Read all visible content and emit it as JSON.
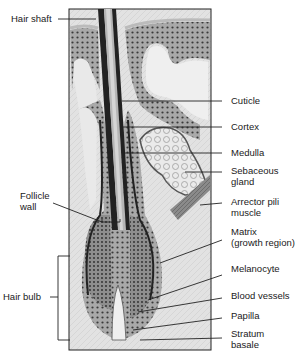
{
  "diagram": {
    "left_labels": [
      {
        "id": "hair-shaft",
        "text": "Hair shaft"
      },
      {
        "id": "follicle-wall",
        "text": "Follicle\nwall"
      },
      {
        "id": "hair-bulb",
        "text": "Hair bulb"
      }
    ],
    "right_labels": [
      {
        "id": "cuticle",
        "text": "Cuticle"
      },
      {
        "id": "cortex",
        "text": "Cortex"
      },
      {
        "id": "medulla",
        "text": "Medulla"
      },
      {
        "id": "sebaceous-gland",
        "text": "Sebaceous\ngland"
      },
      {
        "id": "arrector-pili-muscle",
        "text": "Arrector pili\nmuscle"
      },
      {
        "id": "matrix",
        "text": "Matrix\n(growth region)"
      },
      {
        "id": "melanocyte",
        "text": "Melanocyte"
      },
      {
        "id": "blood-vessels",
        "text": "Blood vessels"
      },
      {
        "id": "papilla",
        "text": "Papilla"
      },
      {
        "id": "stratum-basale",
        "text": "Stratum\nbasale"
      }
    ]
  }
}
